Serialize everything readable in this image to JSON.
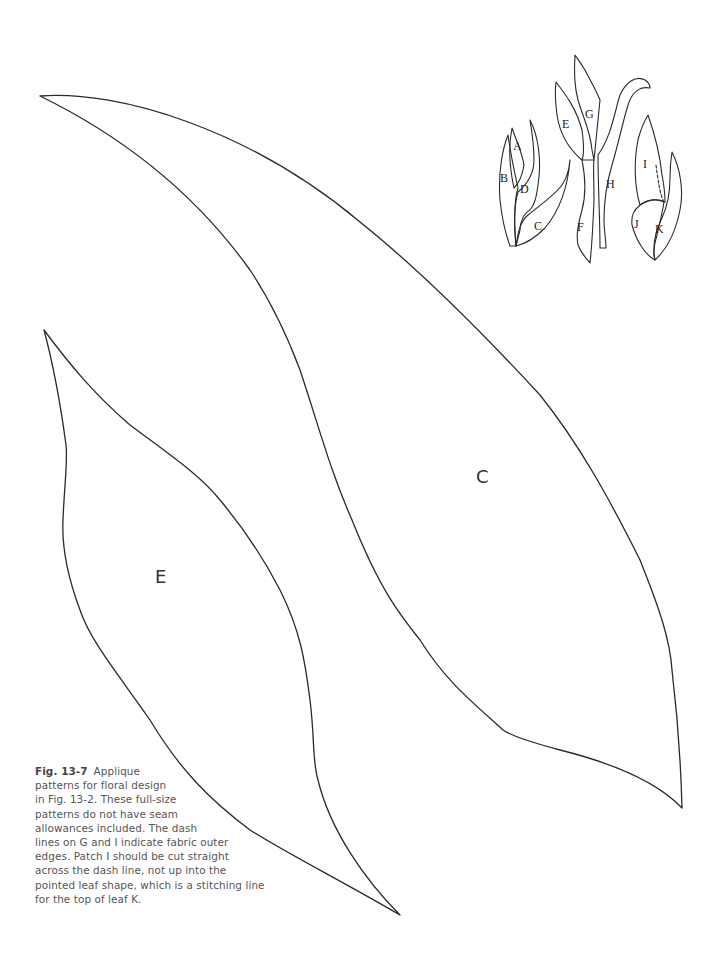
{
  "figure": {
    "number": "Fig. 13-7",
    "caption_lines": [
      "Applique",
      "patterns for floral design",
      "in Fig. 13-2. These full-size",
      "patterns do not have seam",
      "allowances included. The dash",
      "lines on G and I indicate fabric outer",
      "edges. Patch I should be cut straight",
      "across the dash line, not up into the",
      "pointed leaf shape, which is a stitching line",
      "for the top of leaf K."
    ]
  },
  "patterns": {
    "large_leaf_c": {
      "label": "C"
    },
    "large_leaf_e": {
      "label": "E"
    }
  },
  "key_diagram": {
    "labels": [
      "A",
      "B",
      "C",
      "D",
      "E",
      "F",
      "G",
      "H",
      "I",
      "J",
      "K"
    ]
  },
  "colors": {
    "line": "#2a2a2a",
    "caption_text": "#555555",
    "background": "#ffffff"
  }
}
